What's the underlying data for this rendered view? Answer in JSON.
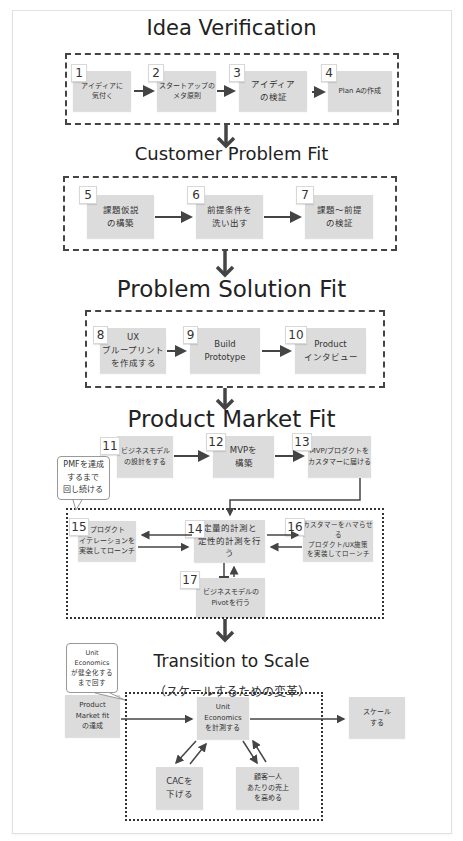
{
  "header_cut_text": "",
  "stages": {
    "idea_verification": {
      "title": "Idea Verification",
      "steps": [
        {
          "num": "1",
          "label": "アイディアに\n気付く"
        },
        {
          "num": "2",
          "label": "スタートアップの\nメタ原則"
        },
        {
          "num": "3",
          "label": "アイディア\nの検証"
        },
        {
          "num": "4",
          "label": "Plan Aの作成"
        }
      ]
    },
    "customer_problem_fit": {
      "title": "Customer Problem Fit",
      "steps": [
        {
          "num": "5",
          "label": "課題仮説\nの構築"
        },
        {
          "num": "6",
          "label": "前提条件を\n洗い出す"
        },
        {
          "num": "7",
          "label": "課題〜前提\nの検証"
        }
      ]
    },
    "problem_solution_fit": {
      "title": "Problem Solution Fit",
      "steps": [
        {
          "num": "8",
          "label": "UX\nブループリント\nを作成する"
        },
        {
          "num": "9",
          "label": "Build\nPrototype"
        },
        {
          "num": "10",
          "label": "Product\nインタビュー"
        }
      ]
    },
    "product_market_fit": {
      "title": "Product Market Fit",
      "callout": "PMFを達成\nするまで\n回し続ける",
      "steps": [
        {
          "num": "11",
          "label": "ビジネスモデル\nの設計をする"
        },
        {
          "num": "12",
          "label": "MVPを\n構築"
        },
        {
          "num": "13",
          "label": "MVP/プロダクトを\nカスタマーに届ける"
        },
        {
          "num": "14",
          "label": "定量的計測と\n定性的計測を行う"
        },
        {
          "num": "15",
          "label": "プロダクト\nイテレーションを\n実装してローンチ"
        },
        {
          "num": "16",
          "label": "カスタマーをハマらせる\nプロダクト/UX施策\nを実装してローンチ"
        },
        {
          "num": "17",
          "label": "ビジネスモデルの\nPivotを行う"
        }
      ]
    },
    "transition_to_scale": {
      "title": "Transition to Scale",
      "subtitle": "（スケールするための変革）",
      "callout": "Unit\nEconomics\nが健全化する\nまで回す",
      "nodes": {
        "pmf_achieved": "Product\nMarket fit\nの達成",
        "unit_economics": "Unit\nEconomics\nを計測する",
        "scale": "スケール\nする",
        "lower_cac": "CACを\n下げる",
        "raise_arpu": "顧客一人\nあたりの売上\nを高める"
      }
    }
  },
  "colors": {
    "box_fill": "#dcdcdc",
    "arrow": "#444444",
    "dash": "#444444"
  }
}
